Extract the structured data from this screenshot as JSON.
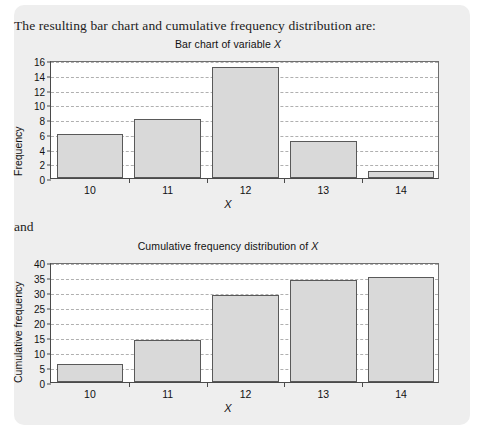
{
  "page": {
    "intro_text": "The resulting bar chart and cumulative frequency distribution are:",
    "connector_text": "and",
    "panel_bg": "#eeeeee",
    "bar_fill": "#d9d9d9",
    "bar_stroke": "#595959",
    "axis_color": "#4a4a4a",
    "grid_color": "#b0b0b0"
  },
  "chart_data": [
    {
      "type": "bar",
      "title": "Bar chart of variable X",
      "title_prefix": "Bar chart of variable ",
      "title_variable": "X",
      "xlabel": "X",
      "ylabel": "Frequency",
      "categories": [
        "10",
        "11",
        "12",
        "13",
        "14"
      ],
      "values": [
        6,
        8,
        15,
        5,
        1
      ],
      "ylim": [
        0,
        16
      ],
      "ytick_step": 2,
      "yticks": [
        0,
        2,
        4,
        6,
        8,
        10,
        12,
        14,
        16
      ],
      "grid": true,
      "grid_style": "dashed-horizontal",
      "legend": "none"
    },
    {
      "type": "bar",
      "title": "Cumulative frequency distribution of X",
      "title_prefix": "Cumulative frequency distribution of ",
      "title_variable": "X",
      "xlabel": "X",
      "ylabel": "Cumulative frequency",
      "categories": [
        "10",
        "11",
        "12",
        "13",
        "14"
      ],
      "values": [
        6,
        14,
        29,
        34,
        35
      ],
      "ylim": [
        0,
        40
      ],
      "ytick_step": 5,
      "yticks": [
        0,
        5,
        10,
        15,
        20,
        25,
        30,
        35,
        40
      ],
      "grid": true,
      "grid_style": "dashed-horizontal",
      "legend": "none"
    }
  ]
}
